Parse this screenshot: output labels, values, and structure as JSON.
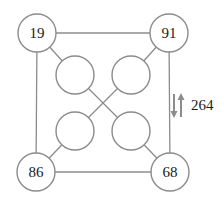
{
  "diagram": {
    "corner_nodes": [
      {
        "id": "top-left",
        "value": "19"
      },
      {
        "id": "top-right",
        "value": "91"
      },
      {
        "id": "bottom-left",
        "value": "86"
      },
      {
        "id": "bottom-right",
        "value": "68"
      }
    ],
    "inner_nodes": [
      {
        "id": "inner-top-left",
        "value": ""
      },
      {
        "id": "inner-top-right",
        "value": ""
      },
      {
        "id": "inner-bottom-left",
        "value": ""
      },
      {
        "id": "inner-bottom-right",
        "value": ""
      }
    ],
    "edges": [
      [
        "top-left",
        "top-right"
      ],
      [
        "top-left",
        "bottom-left"
      ],
      [
        "bottom-left",
        "bottom-right"
      ],
      [
        "top-right",
        "bottom-right"
      ],
      [
        "top-left",
        "inner-top-left"
      ],
      [
        "top-right",
        "inner-top-right"
      ],
      [
        "bottom-left",
        "inner-bottom-left"
      ],
      [
        "bottom-right",
        "inner-bottom-right"
      ],
      [
        "inner-top-left",
        "inner-bottom-right"
      ],
      [
        "inner-top-right",
        "inner-bottom-left"
      ]
    ],
    "annotation": {
      "label": "264",
      "icon": "up-down-arrows-icon"
    }
  }
}
